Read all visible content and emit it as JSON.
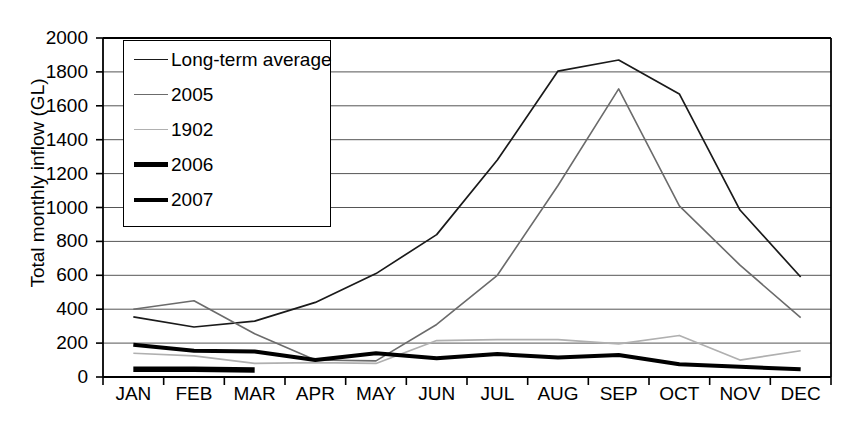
{
  "chart_data": {
    "type": "line",
    "title": "",
    "xlabel": "",
    "ylabel": "Total monthly inflow (GL)",
    "categories": [
      "JAN",
      "FEB",
      "MAR",
      "APR",
      "MAY",
      "JUN",
      "JUL",
      "AUG",
      "SEP",
      "OCT",
      "NOV",
      "DEC"
    ],
    "ylim": [
      0,
      2000
    ],
    "ytick_step": 200,
    "yticks": [
      2000,
      1800,
      1600,
      1400,
      1200,
      1000,
      800,
      600,
      400,
      200,
      0
    ],
    "grid": "horizontal",
    "legend_position": "top-left-inside",
    "series": [
      {
        "name": "Long-term average",
        "style": "thin-dark",
        "color": "#1a1a1a",
        "width": 1.7,
        "values": [
          355,
          295,
          330,
          440,
          610,
          840,
          1280,
          1805,
          1870,
          1670,
          985,
          590
        ]
      },
      {
        "name": "2005",
        "style": "thin-grey",
        "color": "#6b6b6b",
        "width": 1.6,
        "values": [
          400,
          450,
          255,
          100,
          95,
          310,
          600,
          1130,
          1700,
          1010,
          660,
          350
        ]
      },
      {
        "name": "1902",
        "style": "thin-light",
        "color": "#b0b0b0",
        "width": 1.7,
        "values": [
          140,
          125,
          80,
          85,
          80,
          215,
          220,
          220,
          195,
          245,
          100,
          155
        ]
      },
      {
        "name": "2006",
        "style": "thick-black",
        "color": "#000000",
        "width": 5.5,
        "values": [
          45,
          45,
          42,
          null,
          null,
          null,
          null,
          null,
          null,
          null,
          null,
          null
        ]
      },
      {
        "name": "2007",
        "style": "thick-black",
        "color": "#000000",
        "width": 4.0,
        "values": [
          190,
          155,
          150,
          100,
          140,
          110,
          135,
          115,
          130,
          75,
          60,
          45
        ]
      }
    ]
  },
  "legend": {
    "entries": [
      {
        "label": "Long-term average"
      },
      {
        "label": "2005"
      },
      {
        "label": "1902"
      },
      {
        "label": "2006"
      },
      {
        "label": "2007"
      }
    ]
  }
}
